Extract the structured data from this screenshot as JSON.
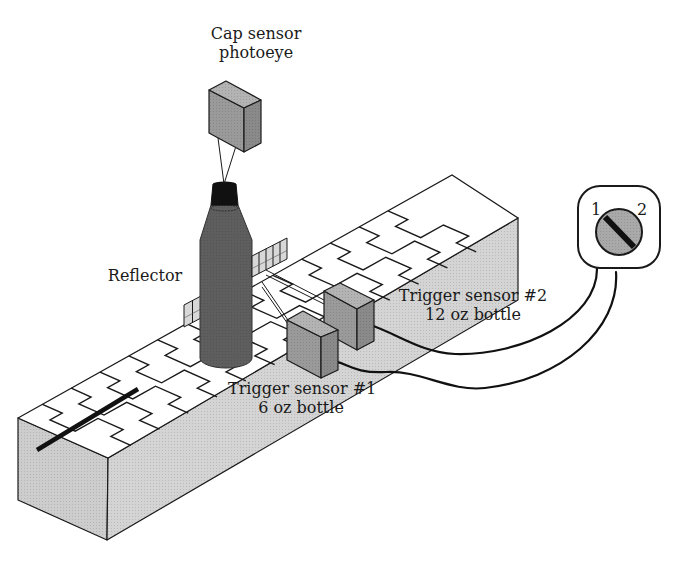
{
  "figure": {
    "labels": {
      "cap_sensor": [
        "Cap sensor",
        "photoeye"
      ],
      "reflector": "Reflector",
      "trigger1": [
        "Trigger sensor #1",
        "6 oz bottle"
      ],
      "trigger2": [
        "Trigger sensor #2",
        "12 oz bottle"
      ],
      "switch_positions": [
        "1",
        "2"
      ]
    },
    "colors": {
      "belt_top": "#ffffff",
      "conveyor_side": "#d4d4d4",
      "conveyor_end": "#cdcdcd",
      "bottle": "#5e5e5e",
      "cap": "#111111",
      "sensor_front": "#9a9a9a",
      "sensor_top": "#b3b3b3",
      "sensor_side": "#8a8a8a",
      "reflector": "#d8d8d8",
      "switch_knob": "#a9a9a9",
      "stroke": "#1a1a1a"
    },
    "conveyor": {
      "top": [
        [
          18,
          418
        ],
        [
          452,
          175
        ],
        [
          518,
          218
        ],
        [
          108,
          458
        ]
      ],
      "front": [
        [
          108,
          458
        ],
        [
          518,
          218
        ],
        [
          518,
          300
        ],
        [
          107,
          540
        ]
      ],
      "end": [
        [
          18,
          418
        ],
        [
          108,
          458
        ],
        [
          107,
          540
        ],
        [
          18,
          500
        ]
      ],
      "link_count": 13,
      "link_pitch": 33,
      "bar": [
        [
          37,
          450
        ],
        [
          138,
          389
        ]
      ]
    },
    "cap_sensor": {
      "front": [
        [
          209,
          90
        ],
        [
          244,
          108
        ],
        [
          244,
          152
        ],
        [
          209,
          133
        ]
      ],
      "top": [
        [
          209,
          90
        ],
        [
          226,
          81
        ],
        [
          261,
          100
        ],
        [
          244,
          108
        ]
      ],
      "right": [
        [
          244,
          108
        ],
        [
          261,
          100
        ],
        [
          261,
          143
        ],
        [
          244,
          152
        ]
      ],
      "beams": [
        [
          [
            218,
            138
          ],
          [
            224,
            184
          ]
        ],
        [
          [
            236,
            146
          ],
          [
            224,
            184
          ]
        ]
      ]
    },
    "bottle": {
      "cap": [
        [
          213,
          184
        ],
        [
          236,
          184
        ],
        [
          238,
          205
        ],
        [
          211,
          205
        ]
      ],
      "body_x": [
        200,
        252
      ],
      "shoulder_y": 240,
      "neck_y": 205,
      "bottom_y": 366
    },
    "reflector": {
      "left": [
        [
          184,
          305
        ],
        [
          201,
          296
        ],
        [
          201,
          318
        ],
        [
          184,
          327
        ]
      ],
      "right": [
        [
          252,
          256
        ],
        [
          287,
          238
        ],
        [
          287,
          259
        ],
        [
          252,
          277
        ]
      ],
      "left_cells": 2,
      "right_cells": 5
    },
    "trigger2": {
      "front": [
        [
          324,
          291
        ],
        [
          357,
          309
        ],
        [
          357,
          350
        ],
        [
          324,
          332
        ]
      ],
      "top": [
        [
          324,
          291
        ],
        [
          340,
          283
        ],
        [
          374,
          300
        ],
        [
          357,
          309
        ]
      ],
      "right": [
        [
          357,
          309
        ],
        [
          374,
          300
        ],
        [
          374,
          341
        ],
        [
          357,
          350
        ]
      ],
      "beam": [
        [
          266,
          270
        ],
        [
          324,
          300
        ]
      ]
    },
    "trigger1": {
      "front": [
        [
          287,
          320
        ],
        [
          321,
          337
        ],
        [
          321,
          378
        ],
        [
          287,
          360
        ]
      ],
      "top": [
        [
          287,
          320
        ],
        [
          303,
          311
        ],
        [
          338,
          330
        ],
        [
          321,
          337
        ]
      ],
      "right": [
        [
          321,
          337
        ],
        [
          338,
          330
        ],
        [
          338,
          370
        ],
        [
          321,
          378
        ]
      ],
      "beam": [
        [
          262,
          282
        ],
        [
          290,
          323
        ]
      ]
    },
    "cables": [
      "M 368 324 C 400 335, 420 352, 455 354 C 520 356, 598 320, 597 268",
      "M 329 361 C 345 360, 350 374, 386 372 C 420 370, 450 392, 485 388 C 560 380, 620 330, 616 272"
    ],
    "switch": {
      "box": {
        "x": 578,
        "y": 186,
        "w": 82,
        "h": 82,
        "r": 22
      },
      "knob": {
        "cx": 619,
        "cy": 232,
        "r": 23
      },
      "slot": [
        [
          605,
          217
        ],
        [
          634,
          247
        ]
      ],
      "pos1": [
        596,
        210
      ],
      "pos2": [
        641,
        210
      ]
    }
  }
}
